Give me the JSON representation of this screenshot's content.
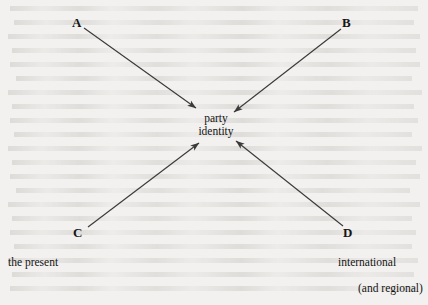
{
  "diagram": {
    "background_color": "#f2f1ef",
    "ink_color": "#3a3a3a",
    "center": {
      "line1": "party",
      "line2": "identity"
    },
    "nodes": [
      {
        "id": "A",
        "label": "A"
      },
      {
        "id": "B",
        "label": "B"
      },
      {
        "id": "C",
        "label": "C"
      },
      {
        "id": "D",
        "label": "D"
      }
    ],
    "captions": {
      "bottom_left": "the present",
      "bottom_right_line1": "international",
      "bottom_right_line2": "(and regional)"
    },
    "arrows": [
      {
        "from": "A",
        "to": "party identity",
        "direction": "down-right"
      },
      {
        "from": "B",
        "to": "party identity",
        "direction": "down-left"
      },
      {
        "from": "C",
        "to": "party identity",
        "direction": "up-right"
      },
      {
        "from": "D",
        "to": "party identity",
        "direction": "up-left"
      }
    ]
  }
}
